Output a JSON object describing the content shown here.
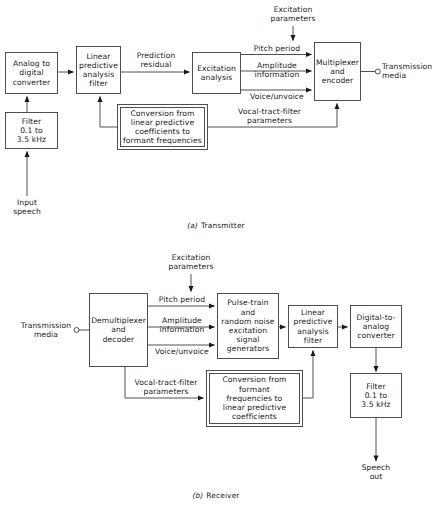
{
  "figure": {
    "captions": {
      "transmitter": "Transmitter",
      "transmitter_letter": "(a)",
      "receiver": "Receiver",
      "receiver_letter": "(b)"
    },
    "colors": {
      "line": "#1a1a1a",
      "background": "#ffffff",
      "text": "#1a1a1a"
    }
  },
  "transmitter": {
    "blocks": {
      "analog_to_digital": "Analog to\ndigital\nconverter",
      "filter": "Filter\n0.1 to\n3.5 kHz",
      "lpc_filter": "Linear\npredictive\nanalysis\nfilter",
      "excitation_analysis": "Excitation\nanalysis",
      "multiplexer": "Multiplexer\nand\nencoder",
      "conversion": "Conversion from\nlinear predictive\ncoefficients to\nformant frequencies"
    },
    "labels": {
      "excitation_parameters": "Excitation\nparameters",
      "prediction_residual": "Prediction\nresidual",
      "pitch_period": "Pitch period",
      "amplitude_information": "Amplitude\ninformation",
      "voice_unvoice": "Voice/unvoice",
      "vocal_tract_filter_parameters": "Vocal-tract-filter\nparameters",
      "transmission_media": "Transmission\nmedia",
      "input_speech": "Input\nspeech"
    }
  },
  "receiver": {
    "blocks": {
      "demultiplexer": "Demultiplexer\nand\ndecoder",
      "pulse_train": "Pulse-train\nand\nrandom noise\nexcitation\nsignal\ngenerators",
      "lpc_filter": "Linear\npredictive\nanalysis\nfilter",
      "digital_to_analog": "Digital-to-\nanalog\nconverter",
      "filter": "Filter\n0.1 to\n3.5 kHz",
      "conversion": "Conversion from\nformant\nfrequencies to\nlinear predictive\ncoefficients"
    },
    "labels": {
      "excitation_parameters": "Excitation\nparameters",
      "pitch_period": "Pitch period",
      "amplitude_information": "Amplitude\ninformation",
      "voice_unvoice": "Voice/unvoice",
      "vocal_tract_filter_parameters": "Vocal-tract-filter\nparameters",
      "transmission_media": "Transmission\nmedia",
      "speech_out": "Speech\nout"
    }
  }
}
